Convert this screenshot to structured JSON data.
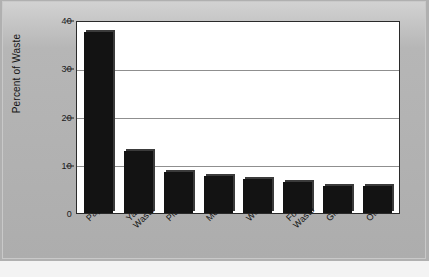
{
  "chart_data": {
    "type": "bar",
    "title": "",
    "subtitle": "",
    "xlabel": "",
    "ylabel": "Percent of Waste",
    "categories": [
      "Paper",
      "Yard Waste",
      "Plastic",
      "Metals",
      "Wood",
      "Food Waste",
      "Glass",
      "Other"
    ],
    "category_lines": [
      [
        "Paper"
      ],
      [
        "Yard",
        "Waste"
      ],
      [
        "Plastic"
      ],
      [
        "Metals"
      ],
      [
        "Wood"
      ],
      [
        "Food",
        "Waste"
      ],
      [
        "Glass"
      ],
      [
        "Other"
      ]
    ],
    "values": [
      38,
      13,
      8.5,
      7.8,
      7.2,
      6.6,
      5.7,
      5.7
    ],
    "ylim": [
      0,
      40
    ],
    "yticks": [
      0,
      10,
      20,
      30,
      40
    ],
    "ytick_labels": [
      "0",
      "10",
      "20",
      "30",
      "40"
    ],
    "grid": true,
    "grid_axis": "y",
    "legend": false,
    "legend_position": "none",
    "bar_color": "#131313",
    "plot_background": "#ffffff",
    "figure_background": "#b0b0b0",
    "axis_color": "#2a2a2a",
    "gridline_color": "#8f8f8f"
  }
}
